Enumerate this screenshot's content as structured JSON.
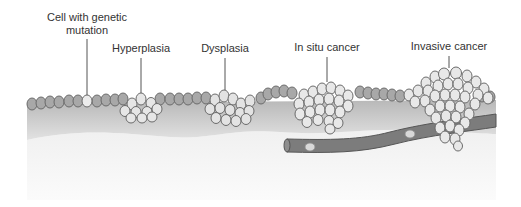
{
  "diagram": {
    "labels": [
      {
        "id": "mutation",
        "lines": [
          "Cell with genetic",
          "mutation"
        ],
        "x": 87,
        "y": 11,
        "pointer": [
          87,
          39,
          87,
          97
        ]
      },
      {
        "id": "hyperplasia",
        "lines": [
          "Hyperplasia"
        ],
        "x": 141,
        "y": 42,
        "pointer": [
          141,
          58,
          141,
          97
        ]
      },
      {
        "id": "dysplasia",
        "lines": [
          "Dysplasia"
        ],
        "x": 225,
        "y": 42,
        "pointer": [
          225,
          58,
          225,
          95
        ]
      },
      {
        "id": "in-situ",
        "lines": [
          "In situ cancer"
        ],
        "x": 327,
        "y": 41,
        "pointer": [
          327,
          57,
          327,
          90
        ]
      },
      {
        "id": "invasive",
        "lines": [
          "Invasive cancer"
        ],
        "x": 449,
        "y": 40,
        "pointer": [
          449,
          56,
          449,
          75
        ]
      }
    ],
    "colors": {
      "normal_cell_fill": "#a9a9a9",
      "abnormal_cell_fill": "#eeeeee",
      "cell_stroke": "#6b6b6b",
      "tissue_top": "#bdbdbd",
      "tissue_bottom": "#e4e4e4",
      "connective": "#f4f4f4",
      "vessel": "#7a7a7a",
      "vessel_stroke": "#555555",
      "text": "#333333",
      "pointer": "#555555"
    }
  }
}
